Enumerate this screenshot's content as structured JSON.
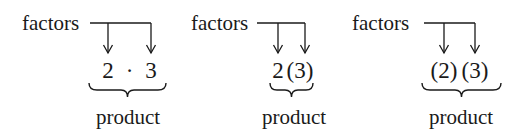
{
  "diagram": {
    "panels": [
      {
        "id": "dot-notation",
        "factors_label": "factors",
        "expression": "2 · 3",
        "expression_parts": [
          "2",
          "·",
          "3"
        ],
        "product_label": "product"
      },
      {
        "id": "juxtaposition-paren-notation",
        "factors_label": "factors",
        "expression": "2(3)",
        "expression_parts": [
          "2",
          "(3)"
        ],
        "product_label": "product"
      },
      {
        "id": "double-paren-notation",
        "factors_label": "factors",
        "expression": "(2)(3)",
        "expression_parts": [
          "(2)",
          "(3)"
        ],
        "product_label": "product"
      }
    ],
    "colors": {
      "ink": "#1a1a1a",
      "background": "#ffffff"
    }
  }
}
